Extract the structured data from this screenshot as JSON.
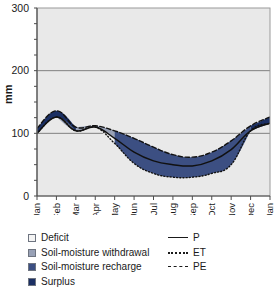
{
  "chart_data": {
    "type": "area",
    "title": "",
    "xlabel": "",
    "ylabel": "mm",
    "ylim": [
      0,
      300
    ],
    "yticks": [
      0,
      100,
      200,
      300
    ],
    "yminor_step": 25,
    "grid": true,
    "grid_values": [
      100,
      200
    ],
    "categories": [
      "Jan",
      "Feb",
      "Mar",
      "Apr",
      "May",
      "Jun",
      "Jul",
      "Aug",
      "Sep",
      "Oct",
      "Nov",
      "Dec",
      "Jan"
    ],
    "x": [
      0,
      1,
      2,
      3,
      4,
      5,
      6,
      7,
      8,
      9,
      10,
      11,
      12
    ],
    "series": [
      {
        "name": "P",
        "style": "solid",
        "values": [
          100,
          126,
          104,
          110,
          92,
          70,
          56,
          50,
          48,
          56,
          74,
          104,
          116
        ]
      },
      {
        "name": "ET",
        "style": "dotted",
        "values": [
          100,
          126,
          104,
          110,
          84,
          52,
          36,
          30,
          30,
          36,
          50,
          104,
          116
        ]
      },
      {
        "name": "PE",
        "style": "dashed",
        "values": [
          108,
          136,
          110,
          112,
          104,
          92,
          78,
          66,
          62,
          70,
          88,
          112,
          126
        ]
      }
    ],
    "bands": [
      {
        "name": "Deficit",
        "color": "#f2f2f2",
        "between": [
          "PE",
          "ET"
        ],
        "months": "Apr-Nov"
      },
      {
        "name": "Soil-moisture withdrawal",
        "color": "#8c96ae",
        "between": [
          "PE",
          "P"
        ],
        "months": "Mar-May"
      },
      {
        "name": "Soil-moisture recharge",
        "color": "#27407a",
        "between": [
          "PE",
          "ET"
        ],
        "months": "Sep-Dec"
      },
      {
        "name": "Surplus",
        "color": "#1b2f63",
        "between": [
          "P",
          "PE"
        ],
        "months": "Dec-Jan"
      }
    ]
  },
  "axes": {
    "ylabel": "mm",
    "yticks": [
      "0",
      "100",
      "200",
      "300"
    ],
    "xticks": [
      "Jan",
      "Feb",
      "Mar",
      "Apr",
      "May",
      "Jun",
      "Jul",
      "Aug",
      "Sep",
      "Oct",
      "Nov",
      "Dec",
      "Jan"
    ]
  },
  "legend": {
    "swatch_items": [
      {
        "label": "Deficit",
        "color": "#f4f4f4"
      },
      {
        "label": "Soil-moisture withdrawal",
        "color": "#98a1b6"
      },
      {
        "label": "Soil-moisture recharge",
        "color": "#3c4f82"
      },
      {
        "label": "Surplus",
        "color": "#1b2f63"
      }
    ],
    "line_items": [
      {
        "label": "P",
        "style": "solid"
      },
      {
        "label": "ET",
        "style": "dotted"
      },
      {
        "label": "PE",
        "style": "dashed"
      }
    ]
  },
  "colors": {
    "plot_background": "#e9e9e9",
    "grid": "#808080",
    "axis": "#4d4d4d",
    "deficit": "#f4f4f4",
    "withdrawal": "#98a1b6",
    "recharge": "#3c4f82",
    "surplus": "#1b2f63",
    "curve": "#111111"
  }
}
